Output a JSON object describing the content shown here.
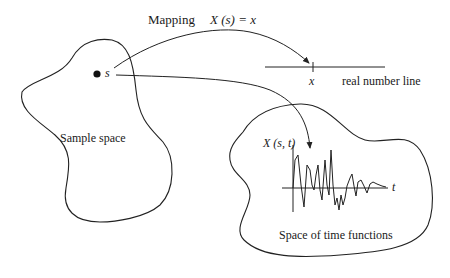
{
  "diagram": {
    "mapping_label": "Mapping",
    "mapping_formula": "X (s) = x",
    "sample_point_label": "s",
    "sample_space_label": "Sample space",
    "number_line_point_label": "x",
    "number_line_label": "real number line",
    "function_label": "X (s, t)",
    "time_axis_label": "t",
    "function_space_label": "Space of time functions"
  },
  "colors": {
    "stroke": "#222222",
    "background": "#ffffff"
  }
}
